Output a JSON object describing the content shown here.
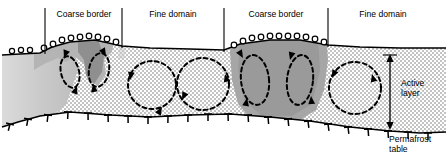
{
  "figure": {
    "type": "cross-section-diagram",
    "width": 448,
    "height": 163
  },
  "top_labels": [
    {
      "text": "Coarse border",
      "x": 84,
      "y": 17
    },
    {
      "text": "Fine domain",
      "x": 173,
      "y": 17
    },
    {
      "text": "Coarse border",
      "x": 276,
      "y": 17
    },
    {
      "text": "Fine domain",
      "x": 363,
      "y": 17
    }
  ],
  "dividers": [
    {
      "x": 45,
      "y1": 8,
      "y2": 54
    },
    {
      "x": 122,
      "y1": 8,
      "y2": 48
    },
    {
      "x": 224,
      "y1": 8,
      "y2": 52
    },
    {
      "x": 328,
      "y1": 8,
      "y2": 47
    }
  ],
  "right_labels": {
    "active_layer": {
      "line1": "Active",
      "line2": "layer",
      "x": 404,
      "y": 89
    },
    "permafrost_table": {
      "line1": "Permafrost",
      "line2": "table",
      "x": 392,
      "y": 140
    }
  },
  "scale_arrow": {
    "name": "active-layer-depth-arrow",
    "x": 390,
    "y_top": 57,
    "y_bottom": 127
  },
  "colors": {
    "coarse_light": "#cfcfcf",
    "coarse_mid": "#b6b6b6",
    "coarse_dark": "#9a9a9a",
    "fine_stipple_dot": "#6a6a6a",
    "fine_background": "#ffffff",
    "outline": "#000000",
    "arrow": "#000000"
  },
  "legend_semantics": {
    "surface_clasts": "open circles = coarse stones at ground surface",
    "stipple": "dotted stipple = fine-grained domain",
    "grey_fill": "grey shading = coarse border material",
    "dashed_loops": "dashed arrow loops = convective soil circulation cells",
    "tee_ticks": "T symbols = permafrost table"
  },
  "circulation_cells": [
    {
      "name": "cell-coarse-left-a",
      "cx": 70,
      "cy": 72,
      "rx": 9,
      "ry": 15,
      "style": "narrow"
    },
    {
      "name": "cell-coarse-left-b",
      "cx": 99,
      "cy": 70,
      "rx": 10,
      "ry": 16,
      "style": "narrow"
    },
    {
      "name": "cell-fine-1",
      "cx": 152,
      "cy": 85,
      "rx": 24,
      "ry": 24,
      "style": "round"
    },
    {
      "name": "cell-fine-2",
      "cx": 203,
      "cy": 84,
      "rx": 26,
      "ry": 26,
      "style": "round"
    },
    {
      "name": "cell-coarse-right-a",
      "cx": 255,
      "cy": 80,
      "rx": 14,
      "ry": 24,
      "style": "narrow"
    },
    {
      "name": "cell-coarse-right-b",
      "cx": 300,
      "cy": 80,
      "rx": 13,
      "ry": 24,
      "style": "narrow"
    },
    {
      "name": "cell-fine-3",
      "cx": 355,
      "cy": 88,
      "rx": 26,
      "ry": 26,
      "style": "round"
    }
  ]
}
